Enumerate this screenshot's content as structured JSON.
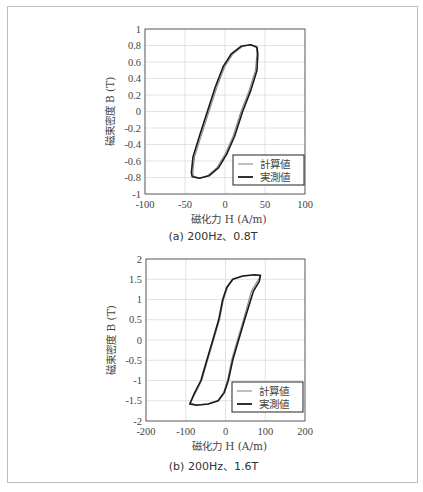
{
  "chart_data": [
    {
      "type": "line",
      "title": "(a) 200Hz、0.8T",
      "xlabel": "磁化力 H (A/m)",
      "ylabel": "磁束密度 B (T)",
      "xlim": [
        -100,
        100
      ],
      "ylim": [
        -1,
        1
      ],
      "xticks": [
        "-100",
        "-50",
        "0",
        "50",
        "100"
      ],
      "yticks": [
        "1",
        "0.8",
        "0.6",
        "0.4",
        "0.2",
        "0",
        "-0.2",
        "-0.4",
        "-0.6",
        "-0.8",
        "-1"
      ],
      "grid": true,
      "legend": {
        "position": "lower right",
        "entries": [
          "計算値",
          "実測値"
        ]
      },
      "series": [
        {
          "name": "計算値",
          "color": "#8a8a8a",
          "points": [
            [
              -40,
              -0.72
            ],
            [
              -38,
              -0.55
            ],
            [
              -30,
              -0.3
            ],
            [
              -20,
              0.0
            ],
            [
              -10,
              0.3
            ],
            [
              0,
              0.55
            ],
            [
              10,
              0.7
            ],
            [
              22,
              0.79
            ],
            [
              32,
              0.81
            ],
            [
              39,
              0.79
            ],
            [
              40,
              0.7
            ],
            [
              38,
              0.5
            ],
            [
              30,
              0.25
            ],
            [
              20,
              0.0
            ],
            [
              10,
              -0.3
            ],
            [
              0,
              -0.52
            ],
            [
              -10,
              -0.68
            ],
            [
              -22,
              -0.78
            ],
            [
              -32,
              -0.81
            ],
            [
              -40,
              -0.78
            ],
            [
              -40,
              -0.72
            ]
          ]
        },
        {
          "name": "実測値",
          "color": "#1a1a1a",
          "points": [
            [
              -42,
              -0.74
            ],
            [
              -40,
              -0.55
            ],
            [
              -32,
              -0.3
            ],
            [
              -22,
              0.0
            ],
            [
              -12,
              0.3
            ],
            [
              -2,
              0.55
            ],
            [
              8,
              0.7
            ],
            [
              20,
              0.79
            ],
            [
              32,
              0.81
            ],
            [
              40,
              0.78
            ],
            [
              41,
              0.7
            ],
            [
              40,
              0.5
            ],
            [
              32,
              0.25
            ],
            [
              22,
              0.0
            ],
            [
              12,
              -0.3
            ],
            [
              2,
              -0.52
            ],
            [
              -8,
              -0.68
            ],
            [
              -20,
              -0.78
            ],
            [
              -32,
              -0.81
            ],
            [
              -41,
              -0.79
            ],
            [
              -42,
              -0.74
            ]
          ]
        }
      ]
    },
    {
      "type": "line",
      "title": "(b) 200Hz、1.6T",
      "xlabel": "磁化力 H (A/m)",
      "ylabel": "磁束密度 B (T)",
      "xlim": [
        -200,
        200
      ],
      "ylim": [
        -2,
        2
      ],
      "xticks": [
        "-200",
        "-100",
        "0",
        "100",
        "200"
      ],
      "yticks": [
        "2",
        "1.5",
        "1",
        "0.5",
        "0",
        "-0.5",
        "-1",
        "-1.5",
        "-2"
      ],
      "grid": true,
      "legend": {
        "position": "lower right",
        "entries": [
          "計算値",
          "実測値"
        ]
      },
      "series": [
        {
          "name": "計算値",
          "color": "#8a8a8a",
          "points": [
            [
              -88,
              -1.55
            ],
            [
              -75,
              -1.3
            ],
            [
              -60,
              -1.0
            ],
            [
              -45,
              -0.5
            ],
            [
              -30,
              0.0
            ],
            [
              -15,
              0.5
            ],
            [
              -5,
              1.0
            ],
            [
              5,
              1.3
            ],
            [
              20,
              1.5
            ],
            [
              45,
              1.58
            ],
            [
              75,
              1.6
            ],
            [
              88,
              1.58
            ],
            [
              80,
              1.45
            ],
            [
              65,
              1.2
            ],
            [
              45,
              0.5
            ],
            [
              30,
              0.0
            ],
            [
              15,
              -0.5
            ],
            [
              5,
              -1.0
            ],
            [
              -5,
              -1.3
            ],
            [
              -20,
              -1.5
            ],
            [
              -45,
              -1.58
            ],
            [
              -75,
              -1.6
            ],
            [
              -88,
              -1.55
            ]
          ]
        },
        {
          "name": "実測値",
          "color": "#1a1a1a",
          "points": [
            [
              -90,
              -1.58
            ],
            [
              -80,
              -1.35
            ],
            [
              -62,
              -1.0
            ],
            [
              -47,
              -0.5
            ],
            [
              -32,
              0.0
            ],
            [
              -17,
              0.5
            ],
            [
              -7,
              1.0
            ],
            [
              3,
              1.3
            ],
            [
              18,
              1.5
            ],
            [
              43,
              1.58
            ],
            [
              73,
              1.61
            ],
            [
              88,
              1.6
            ],
            [
              85,
              1.45
            ],
            [
              70,
              1.2
            ],
            [
              48,
              0.5
            ],
            [
              33,
              0.0
            ],
            [
              18,
              -0.5
            ],
            [
              7,
              -1.0
            ],
            [
              -3,
              -1.3
            ],
            [
              -18,
              -1.5
            ],
            [
              -43,
              -1.58
            ],
            [
              -73,
              -1.61
            ],
            [
              -90,
              -1.58
            ]
          ]
        }
      ]
    }
  ]
}
